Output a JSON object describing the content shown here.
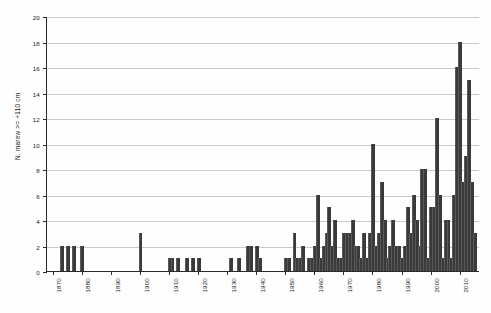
{
  "chart_data": {
    "type": "bar",
    "title": "",
    "subtitle": "",
    "xlabel": "",
    "ylabel": "N. marew >= +110 cm",
    "xlim": [
      1868,
      2017
    ],
    "ylim": [
      0,
      20
    ],
    "grid": true,
    "legend": null,
    "bar_color": "#3a3a3a",
    "axis_color": "#2b2b2b",
    "grid_color": "#c9c9c9",
    "ytick_labels": [
      "0",
      "2",
      "4",
      "6",
      "8",
      "10",
      "12",
      "14",
      "16",
      "18",
      "20"
    ],
    "ytick_values": [
      0,
      2,
      4,
      6,
      8,
      10,
      12,
      14,
      16,
      18,
      20
    ],
    "xtick_labels": [
      "1870",
      "1880",
      "1890",
      "1900",
      "1910",
      "1920",
      "1930",
      "1940",
      "1950",
      "1960",
      "1970",
      "1980",
      "1990",
      "2000",
      "2010"
    ],
    "xtick_values": [
      1870,
      1880,
      1890,
      1900,
      1910,
      1920,
      1930,
      1940,
      1950,
      1960,
      1970,
      1980,
      1990,
      2000,
      2010
    ],
    "x": [
      1870,
      1871,
      1872,
      1873,
      1874,
      1875,
      1876,
      1877,
      1878,
      1879,
      1880,
      1881,
      1882,
      1883,
      1884,
      1885,
      1886,
      1887,
      1888,
      1889,
      1890,
      1891,
      1892,
      1893,
      1894,
      1895,
      1896,
      1897,
      1898,
      1899,
      1900,
      1901,
      1902,
      1903,
      1904,
      1905,
      1906,
      1907,
      1908,
      1909,
      1910,
      1911,
      1912,
      1913,
      1914,
      1915,
      1916,
      1917,
      1918,
      1919,
      1920,
      1921,
      1922,
      1923,
      1924,
      1925,
      1926,
      1927,
      1928,
      1929,
      1930,
      1931,
      1932,
      1933,
      1934,
      1935,
      1936,
      1937,
      1938,
      1939,
      1940,
      1941,
      1942,
      1943,
      1944,
      1945,
      1946,
      1947,
      1948,
      1949,
      1950,
      1951,
      1952,
      1953,
      1954,
      1955,
      1956,
      1957,
      1958,
      1959,
      1960,
      1961,
      1962,
      1963,
      1964,
      1965,
      1966,
      1967,
      1968,
      1969,
      1970,
      1971,
      1972,
      1973,
      1974,
      1975,
      1976,
      1977,
      1978,
      1979,
      1980,
      1981,
      1982,
      1983,
      1984,
      1985,
      1986,
      1987,
      1988,
      1989,
      1990,
      1991,
      1992,
      1993,
      1994,
      1995,
      1996,
      1997,
      1998,
      1999,
      2000,
      2001,
      2002,
      2003,
      2004,
      2005,
      2006,
      2007,
      2008,
      2009,
      2010,
      2011,
      2012,
      2013,
      2014,
      2015
    ],
    "values": [
      0,
      0,
      0,
      2,
      0,
      2,
      0,
      2,
      0,
      0,
      2,
      0,
      0,
      0,
      0,
      0,
      0,
      0,
      0,
      0,
      0,
      0,
      0,
      0,
      0,
      0,
      0,
      0,
      0,
      0,
      3,
      0,
      0,
      0,
      0,
      0,
      0,
      0,
      0,
      0,
      1,
      1,
      0,
      1,
      0,
      0,
      1,
      0,
      1,
      0,
      1,
      0,
      0,
      0,
      0,
      0,
      0,
      0,
      0,
      0,
      0,
      1,
      0,
      0,
      1,
      0,
      0,
      2,
      2,
      0,
      2,
      1,
      0,
      0,
      0,
      0,
      0,
      0,
      0,
      0,
      1,
      1,
      0,
      3,
      1,
      1,
      2,
      0,
      1,
      1,
      2,
      6,
      1,
      2,
      3,
      5,
      2,
      4,
      1,
      1,
      3,
      3,
      3,
      4,
      2,
      2,
      1,
      3,
      1,
      3,
      10,
      2,
      3,
      7,
      4,
      1,
      2,
      4,
      2,
      2,
      1,
      2,
      5,
      3,
      6,
      4,
      2,
      8,
      8,
      1,
      5,
      5,
      12,
      6,
      1,
      4,
      4,
      1,
      6,
      16,
      18,
      7,
      9,
      15,
      7,
      3
    ]
  },
  "axis": {
    "y_title": "N. marew >= +110 cm"
  }
}
